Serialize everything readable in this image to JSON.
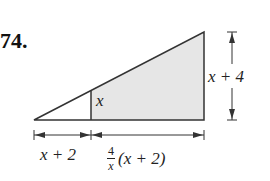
{
  "problem": {
    "number": "74."
  },
  "figure": {
    "labels": {
      "inner_height": "x",
      "right_height": "x + 4",
      "left_base": "x + 2",
      "right_base_coef_num": "4",
      "right_base_coef_den": "x",
      "right_base_expr": "(x + 2)"
    },
    "colors": {
      "stroke": "#333333",
      "shade": "#e6e6e6"
    }
  }
}
